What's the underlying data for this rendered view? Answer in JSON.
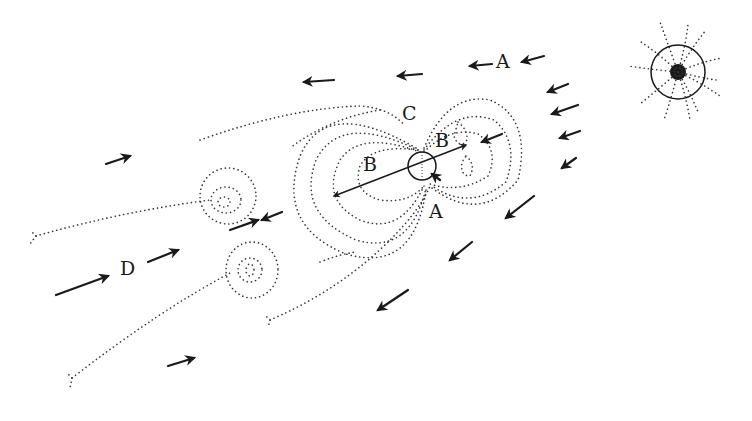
{
  "diagram": {
    "title": "",
    "labels": {
      "A_top": "A",
      "A_bottom": "A",
      "B_left": "B",
      "B_right": "B",
      "C": "C",
      "D": "D"
    },
    "elements": {
      "star": "radiating-star-with-spiral-field-lines",
      "body": "small-circle-body-with-dipole-field",
      "flow_arrows_inbound": "arrows-pointing-left-and-down-left",
      "flow_arrows_outbound": "arrows-pointing-right-up-right",
      "vortices": "two-spiral-vortices-in-wake",
      "tail_lines": "dotted-tail-boundaries-with-forked-ends"
    },
    "colors": {
      "ink": "#1a1a1a",
      "background": "#ffffff"
    }
  }
}
